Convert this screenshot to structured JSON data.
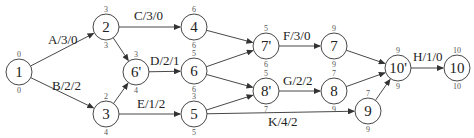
{
  "diagram": {
    "type": "activity-network",
    "nodes": [
      {
        "id": "1",
        "label": "1",
        "x": 19,
        "y": 72,
        "top": "0",
        "bottom": "0"
      },
      {
        "id": "2",
        "label": "2",
        "x": 106,
        "y": 27,
        "top": "3",
        "bottom": "3"
      },
      {
        "id": "3",
        "label": "3",
        "x": 106,
        "y": 114,
        "top": "2",
        "bottom": "4"
      },
      {
        "id": "6p",
        "label": "6'",
        "x": 136,
        "y": 72,
        "top": "3",
        "bottom": "4"
      },
      {
        "id": "4",
        "label": "4",
        "x": 194,
        "y": 27,
        "top": "6",
        "bottom": "6"
      },
      {
        "id": "6",
        "label": "6",
        "x": 194,
        "y": 71,
        "top": "5",
        "bottom": "6"
      },
      {
        "id": "5",
        "label": "5",
        "x": 194,
        "y": 114,
        "top": "3",
        "bottom": "5"
      },
      {
        "id": "7p",
        "label": "7'",
        "x": 266,
        "y": 46,
        "top": "5",
        "bottom": "6"
      },
      {
        "id": "8p",
        "label": "8'",
        "x": 266,
        "y": 91,
        "top": "5",
        "bottom": "7"
      },
      {
        "id": "7",
        "label": "7",
        "x": 334,
        "y": 46,
        "top": "9",
        "bottom": "9"
      },
      {
        "id": "8",
        "label": "8",
        "x": 334,
        "y": 91,
        "top": "7",
        "bottom": "9"
      },
      {
        "id": "9",
        "label": "9",
        "x": 368,
        "y": 111,
        "top": "7",
        "bottom": "9"
      },
      {
        "id": "10p",
        "label": "10'",
        "x": 398,
        "y": 68,
        "top": "9",
        "bottom": "9"
      },
      {
        "id": "10",
        "label": "10",
        "x": 457,
        "y": 68,
        "top": "10",
        "bottom": "10"
      }
    ],
    "edges": [
      {
        "from": "1",
        "to": "2",
        "label": "A/3/0",
        "lx": 48,
        "ly": 44
      },
      {
        "from": "1",
        "to": "3",
        "label": "B/2/2",
        "lx": 52,
        "ly": 90
      },
      {
        "from": "2",
        "to": "4",
        "label": "C/3/0",
        "lx": 134,
        "ly": 20
      },
      {
        "from": "2",
        "to": "6p",
        "label": "",
        "lx": 0,
        "ly": 0
      },
      {
        "from": "3",
        "to": "6p",
        "label": "",
        "lx": 0,
        "ly": 0
      },
      {
        "from": "6p",
        "to": "6",
        "label": "D/2/1",
        "lx": 150,
        "ly": 65
      },
      {
        "from": "3",
        "to": "5",
        "label": "E/1/2",
        "lx": 137,
        "ly": 108
      },
      {
        "from": "4",
        "to": "7p",
        "label": "",
        "lx": 0,
        "ly": 0
      },
      {
        "from": "6",
        "to": "7p",
        "label": "",
        "lx": 0,
        "ly": 0
      },
      {
        "from": "6",
        "to": "8p",
        "label": "",
        "lx": 0,
        "ly": 0
      },
      {
        "from": "5",
        "to": "8p",
        "label": "",
        "lx": 0,
        "ly": 0
      },
      {
        "from": "7p",
        "to": "7",
        "label": "F/3/0",
        "lx": 283,
        "ly": 40
      },
      {
        "from": "8p",
        "to": "8",
        "label": "G/2/2",
        "lx": 283,
        "ly": 85
      },
      {
        "from": "5",
        "to": "9",
        "label": "K/4/2",
        "lx": 268,
        "ly": 126
      },
      {
        "from": "7",
        "to": "10p",
        "label": "",
        "lx": 0,
        "ly": 0
      },
      {
        "from": "8",
        "to": "10p",
        "label": "",
        "lx": 0,
        "ly": 0
      },
      {
        "from": "9",
        "to": "10p",
        "label": "",
        "lx": 0,
        "ly": 0
      },
      {
        "from": "10p",
        "to": "10",
        "label": "H/1/0",
        "lx": 413,
        "ly": 61
      }
    ],
    "colors": {
      "stroke": "#333333",
      "text": "#222222",
      "small_text": "#555555",
      "background": "#ffffff"
    }
  }
}
